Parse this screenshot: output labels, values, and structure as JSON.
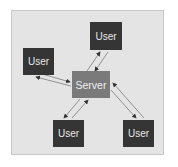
{
  "diagram": {
    "type": "client-server",
    "colors": {
      "panel": "#e4e4e4",
      "user": "#353535",
      "server": "#7a7a7a",
      "arrow": "#6a6a6a"
    },
    "server": {
      "label": "Server"
    },
    "users": [
      {
        "id": "top",
        "label": "User"
      },
      {
        "id": "left",
        "label": "User"
      },
      {
        "id": "bottom-left",
        "label": "User"
      },
      {
        "id": "bottom-right",
        "label": "User"
      }
    ],
    "edges": [
      {
        "from": "server",
        "to": "top",
        "direction": "bidirectional"
      },
      {
        "from": "server",
        "to": "left",
        "direction": "bidirectional"
      },
      {
        "from": "server",
        "to": "bottom-left",
        "direction": "bidirectional"
      },
      {
        "from": "server",
        "to": "bottom-right",
        "direction": "bidirectional"
      }
    ]
  }
}
